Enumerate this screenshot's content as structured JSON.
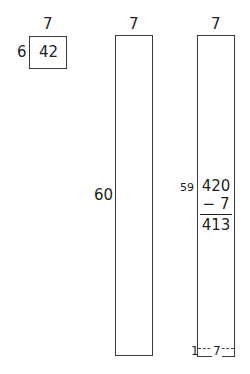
{
  "diagram": {
    "box_small": {
      "top_label": "7",
      "side_label": "6",
      "inner_label": "42"
    },
    "box_tall": {
      "top_label": "7",
      "side_label": "60"
    },
    "box_subtract": {
      "top_label": "7",
      "side_label": "59",
      "minuend": "420",
      "subtrahend": "− 7",
      "difference": "413",
      "removed_strip_height_label": "1",
      "removed_strip_width_label": "7"
    }
  }
}
